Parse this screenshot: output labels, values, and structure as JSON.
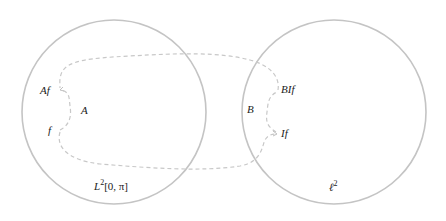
{
  "diagram": {
    "colors": {
      "circle_stroke": "#c4c4c4",
      "dashed_stroke": "#c8c8c8",
      "text": "#222222",
      "background": "#ffffff"
    },
    "spaces": [
      {
        "id": "L2",
        "label_base": "L",
        "label_sup": "2",
        "label_rest": "[0, π]",
        "cx": 114,
        "cy": 112,
        "r": 92
      },
      {
        "id": "l2",
        "label_base": "ℓ",
        "label_sup": "2",
        "label_rest": "",
        "cx": 334,
        "cy": 112,
        "r": 92
      }
    ],
    "points": {
      "f": "f",
      "Af": "Af",
      "If": "If",
      "BIf": "BIf"
    },
    "operators": {
      "A": "A",
      "B": "B"
    }
  }
}
